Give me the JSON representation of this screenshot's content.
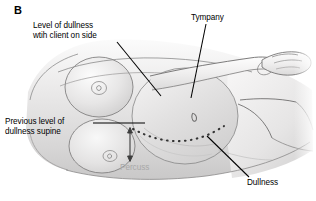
{
  "figure": {
    "panel_letter": "B",
    "background_color": "#ffffff",
    "label_color": "#000000",
    "percuss_color": "#a8a8a8",
    "width": 316,
    "height": 201
  },
  "labels": {
    "level_of_dullness": "Level of dullness\nwtih client on side",
    "tympany": "Tympany",
    "previous_level": "Previous level of\ndullness supine",
    "dullness": "Dullness",
    "percuss": "Percuss"
  },
  "illustration": {
    "style": "grayscale-medical-line-drawing",
    "description": "Client lying on side, lateral view of torso with breast, abdomen, arm and hand",
    "skin_light": "#f3f2f2",
    "skin_mid": "#dedddd",
    "skin_shadow": "#c4c3c3",
    "outline": "#5a5a5a",
    "dotted_line_color": "#3a3a3a",
    "leader_line_color": "#000000",
    "elements": [
      "torso",
      "upper-breast",
      "lower-breast",
      "abdomen-bulge",
      "arm",
      "hand",
      "umbilicus",
      "dotted-supine-dullness-line",
      "percussion-arrow"
    ]
  }
}
